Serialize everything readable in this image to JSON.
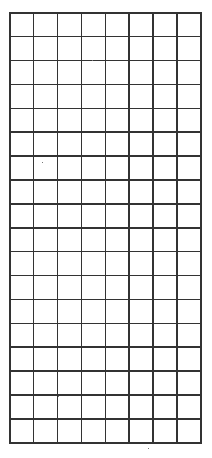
{
  "grid": {
    "rows": 18,
    "columns": 8,
    "line_color": "#333333",
    "background_color": "#ffffff"
  }
}
